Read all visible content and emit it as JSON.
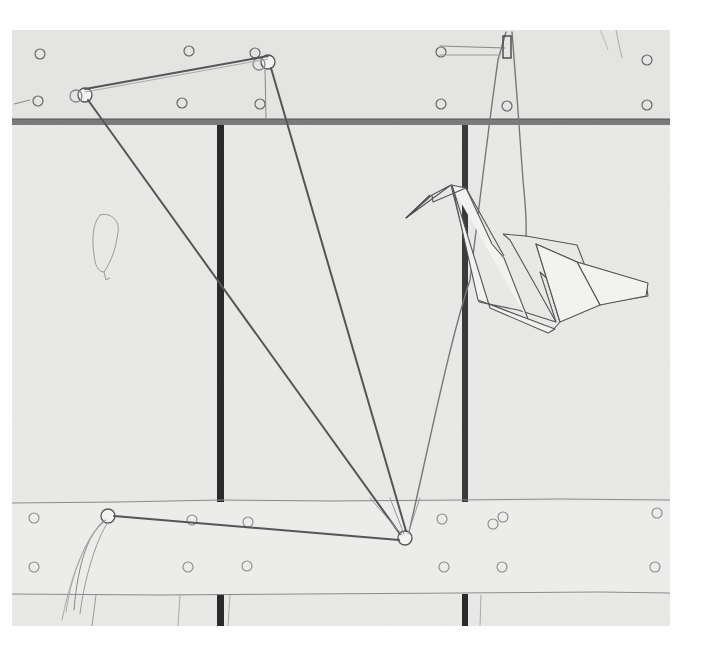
{
  "artwork": {
    "subject": "Pencil drawing of a wooden frame with string, washers and a hanging origami crane",
    "medium": "graphite on paper",
    "tone": "monochrome",
    "colors": {
      "paper": "#e9e9e7",
      "background": "#ffffff",
      "pencil_dark": "#333333",
      "pencil_mid": "#6a6a6a",
      "pencil_light": "#9a9a9a",
      "post_dark": "#2a2a2a"
    },
    "elements": {
      "top_beam": "horizontal rail with rivets at top",
      "bottom_beam": "horizontal plank with rivets near bottom",
      "vertical_posts": 2,
      "string_pulleys": 4,
      "origami_crane": "folded paper crane suspended by string",
      "frayed_string_end": "loose tassel at lower left"
    }
  },
  "caption": {
    "text": ""
  }
}
